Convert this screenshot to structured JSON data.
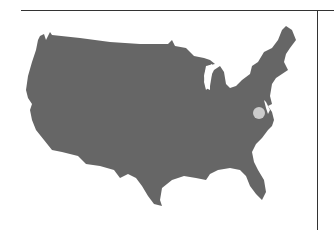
{
  "map": {
    "region": "Contiguous United States",
    "fill_color": "#666666",
    "background_color": "#ffffff",
    "marker": {
      "shape": "circle",
      "color": "#cccccc",
      "approx_location": "Virginia / Washington D.C. area",
      "cx": 259,
      "cy": 113,
      "r": 6
    }
  },
  "frame": {
    "line_color": "#333333",
    "top_line": {
      "x1": 21,
      "x2": 334,
      "y": 10
    },
    "right_line": {
      "x": 317,
      "y1": 10,
      "y2": 230
    }
  }
}
